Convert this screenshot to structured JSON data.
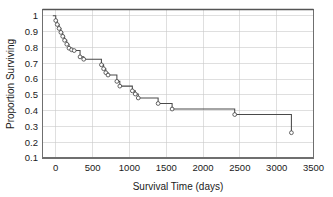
{
  "chart_data": {
    "type": "line",
    "subtype": "kaplan-meier-step",
    "title": "",
    "xlabel": "Survival Time  (days)",
    "ylabel": "Proportion Surviving",
    "xlim": [
      -180,
      3500
    ],
    "ylim": [
      0.1,
      1.04
    ],
    "xticks": [
      0,
      500,
      1000,
      1500,
      2000,
      2500,
      3000,
      3500
    ],
    "xtick_labels": [
      "0",
      "500",
      "1000",
      "1500",
      "2000",
      "2500",
      "3000",
      "3500"
    ],
    "yticks": [
      0.1,
      0.2,
      0.3,
      0.4,
      0.5,
      0.6,
      0.7,
      0.8,
      0.9,
      1.0
    ],
    "ytick_labels": [
      "0.1",
      "0.2",
      "0.3",
      "0.4",
      "0.5",
      "0.6",
      "0.7",
      "0.8",
      "0.9",
      "1"
    ],
    "grid": true,
    "grid_color": "#c9c9c9",
    "legend": "none",
    "line_color": "#4a4a4a",
    "marker_style": "open-circle",
    "marker_face_color": "#ffffff",
    "marker_edge_color": "#3d3d3d",
    "x": [
      0,
      20,
      45,
      70,
      95,
      120,
      150,
      180,
      215,
      250,
      330,
      380,
      620,
      650,
      680,
      710,
      830,
      870,
      1040,
      1080,
      1120,
      1390,
      1580,
      2430,
      3200
    ],
    "y": [
      0.97,
      0.945,
      0.92,
      0.895,
      0.87,
      0.845,
      0.82,
      0.795,
      0.785,
      0.78,
      0.74,
      0.725,
      0.69,
      0.665,
      0.64,
      0.625,
      0.585,
      0.555,
      0.525,
      0.505,
      0.48,
      0.445,
      0.41,
      0.375,
      0.26
    ],
    "points": [
      {
        "x": 0,
        "y": 0.97
      },
      {
        "x": 20,
        "y": 0.945
      },
      {
        "x": 45,
        "y": 0.92
      },
      {
        "x": 70,
        "y": 0.895
      },
      {
        "x": 95,
        "y": 0.87
      },
      {
        "x": 120,
        "y": 0.845
      },
      {
        "x": 150,
        "y": 0.82
      },
      {
        "x": 180,
        "y": 0.795
      },
      {
        "x": 215,
        "y": 0.785
      },
      {
        "x": 250,
        "y": 0.78
      },
      {
        "x": 330,
        "y": 0.74
      },
      {
        "x": 380,
        "y": 0.725
      },
      {
        "x": 620,
        "y": 0.69
      },
      {
        "x": 650,
        "y": 0.665
      },
      {
        "x": 680,
        "y": 0.64
      },
      {
        "x": 710,
        "y": 0.625
      },
      {
        "x": 830,
        "y": 0.585
      },
      {
        "x": 870,
        "y": 0.555
      },
      {
        "x": 1040,
        "y": 0.525
      },
      {
        "x": 1080,
        "y": 0.505
      },
      {
        "x": 1120,
        "y": 0.48
      },
      {
        "x": 1390,
        "y": 0.445
      },
      {
        "x": 1580,
        "y": 0.41
      },
      {
        "x": 2430,
        "y": 0.375
      },
      {
        "x": 3200,
        "y": 0.26
      }
    ],
    "start_point": {
      "x": -40,
      "y": 1.0
    }
  }
}
